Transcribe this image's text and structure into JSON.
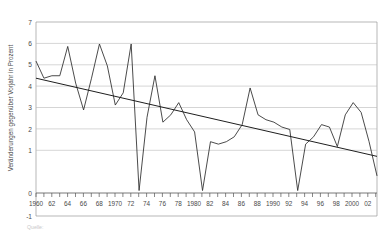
{
  "chart_data": {
    "type": "line",
    "title": "",
    "xlabel": "",
    "ylabel": "Veränderungen gegenüber Vorjahr in Prozent",
    "ylim": [
      -1,
      7
    ],
    "xlim": [
      1960,
      2003
    ],
    "grid": true,
    "legend": "none",
    "yticks": [
      -1,
      0,
      1,
      2,
      3,
      4,
      5,
      6,
      7
    ],
    "ytick_labels": [
      "-1",
      "0",
      "1",
      "2",
      "3",
      "4",
      "5",
      "6",
      "7"
    ],
    "xticks": [
      1960,
      1962,
      1964,
      1966,
      1968,
      1970,
      1972,
      1974,
      1976,
      1978,
      1980,
      1982,
      1984,
      1986,
      1988,
      1990,
      1992,
      1994,
      1996,
      1998,
      2000,
      2002
    ],
    "xtick_labels": [
      "1960",
      "62",
      "64",
      "66",
      "68",
      "1970",
      "72",
      "74",
      "76",
      "78",
      "1980",
      "82",
      "84",
      "86",
      "88",
      "1990",
      "92",
      "94",
      "96",
      "98",
      "2000",
      "02"
    ],
    "x": [
      1960,
      1961,
      1962,
      1963,
      1964,
      1965,
      1966,
      1967,
      1968,
      1969,
      1970,
      1971,
      1972,
      1973,
      1974,
      1975,
      1976,
      1977,
      1978,
      1979,
      1980,
      1981,
      1982,
      1983,
      1984,
      1985,
      1986,
      1987,
      1988,
      1989,
      1990,
      1991,
      1992,
      1993,
      1994,
      1995,
      1996,
      1997,
      1998,
      1999,
      2000,
      2001,
      2002,
      2003
    ],
    "series": [
      {
        "name": "Veränderung gegenüber Vorjahr",
        "values": [
          5.4,
          4.7,
          4.8,
          4.8,
          6.0,
          4.5,
          3.4,
          4.7,
          6.1,
          5.2,
          3.6,
          4.1,
          6.1,
          0.1,
          3.1,
          4.8,
          2.9,
          3.2,
          3.7,
          3.0,
          2.5,
          0.1,
          2.1,
          2.0,
          2.1,
          2.3,
          2.8,
          4.3,
          3.2,
          3.0,
          2.9,
          2.7,
          2.6,
          0.1,
          2.0,
          2.3,
          2.8,
          2.7,
          1.9,
          3.2,
          3.7,
          3.3,
          2.1,
          0.7
        ]
      },
      {
        "name": "Trend",
        "type": "trend",
        "values": [
          4.7,
          1.5
        ],
        "x": [
          1960,
          2003
        ]
      }
    ],
    "source_note": "Quelle:"
  },
  "axis": {
    "ylabel_text": "Veränderungen gegenüber Vorjahr in Prozent"
  }
}
